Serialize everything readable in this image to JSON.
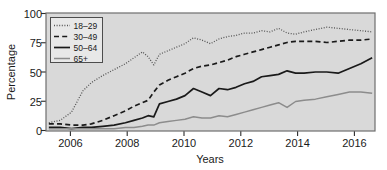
{
  "chart_data": {
    "type": "line",
    "title": "",
    "xlabel": "Years",
    "ylabel": "Percentage",
    "xlim": [
      2005.3,
      2016.9
    ],
    "ylim": [
      0,
      100
    ],
    "xticks": [
      "2006",
      "2008",
      "2010",
      "2012",
      "2014",
      "2016"
    ],
    "xtick_values": [
      2006,
      2008,
      2010,
      2012,
      2014,
      2016
    ],
    "yticks": [
      "0",
      "25",
      "50",
      "75",
      "100"
    ],
    "ytick_values": [
      0,
      25,
      50,
      75,
      100
    ],
    "grid": false,
    "legend_position": "top-left",
    "x": [
      2005.4,
      2005.8,
      2006.2,
      2006.6,
      2006.9,
      2007.3,
      2007.7,
      2008.1,
      2008.4,
      2008.7,
      2008.9,
      2009.1,
      2009.3,
      2009.6,
      2009.9,
      2010.2,
      2010.5,
      2010.8,
      2011.1,
      2011.4,
      2011.7,
      2012.0,
      2012.3,
      2012.6,
      2012.9,
      2013.2,
      2013.5,
      2013.8,
      2014.1,
      2014.4,
      2014.8,
      2015.2,
      2015.6,
      2016.0,
      2016.4,
      2016.8
    ],
    "series": [
      {
        "name": "18–29",
        "style": "dotted",
        "color": "#555555",
        "values": [
          7,
          9,
          16,
          34,
          41,
          47,
          52,
          57,
          62,
          67,
          63,
          56,
          65,
          68,
          71,
          74,
          79,
          77,
          74,
          78,
          80,
          81,
          83,
          83,
          85,
          84,
          87,
          83,
          82,
          84,
          86,
          88,
          87,
          86,
          85,
          84
        ]
      },
      {
        "name": "30–49",
        "style": "dashed",
        "color": "#1a1a1a",
        "values": [
          6,
          6,
          5,
          5,
          6,
          9,
          13,
          17,
          21,
          24,
          26,
          33,
          39,
          43,
          46,
          49,
          53,
          55,
          56,
          58,
          60,
          63,
          65,
          67,
          69,
          71,
          73,
          75,
          76,
          76,
          76,
          75,
          76,
          77,
          77,
          78
        ]
      },
      {
        "name": "50–64",
        "style": "solid",
        "color": "#1a1a1a",
        "values": [
          3,
          3,
          2,
          3,
          3,
          4,
          5,
          7,
          9,
          11,
          13,
          12,
          23,
          25,
          27,
          30,
          36,
          33,
          30,
          36,
          35,
          37,
          40,
          42,
          46,
          47,
          48,
          51,
          49,
          49,
          50,
          50,
          49,
          53,
          57,
          62
        ]
      },
      {
        "name": "65+",
        "style": "solid",
        "color": "#8c8c8c",
        "values": [
          2,
          2,
          2,
          2,
          2,
          2,
          2,
          3,
          3,
          4,
          5,
          5,
          7,
          8,
          9,
          10,
          12,
          11,
          11,
          13,
          12,
          14,
          16,
          18,
          20,
          22,
          24,
          20,
          25,
          26,
          27,
          29,
          31,
          33,
          33,
          32
        ]
      }
    ]
  },
  "legend": {
    "entries": [
      {
        "label": "18–29"
      },
      {
        "label": "30–49"
      },
      {
        "label": "50–64"
      },
      {
        "label": "65+"
      }
    ]
  },
  "colors": {
    "plot_background": "#d9d9d9",
    "page_background": "#ffffff",
    "frame": "#6e6e6e",
    "text": "#1a1a1a",
    "legend_background": "#e8e8e8"
  }
}
